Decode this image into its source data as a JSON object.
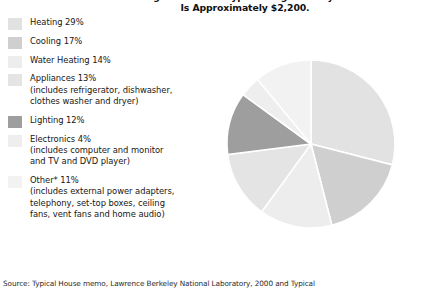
{
  "title": {
    "line1": "Average U.S. Home Typical Single Family Home",
    "line2": "Is Approximately $2,200."
  },
  "legend": [
    {
      "label": "Heating 29%",
      "swatch": "#e2e2e2",
      "name": "heating",
      "sub": []
    },
    {
      "label": "Cooling 17%",
      "swatch": "#cfcfcf",
      "name": "cooling",
      "sub": []
    },
    {
      "label": "Water Heating 14%",
      "swatch": "#ededed",
      "name": "water-heating",
      "sub": []
    },
    {
      "label": "Appliances 13%",
      "swatch": "#e4e4e4",
      "name": "appliances",
      "sub": [
        "(includes refrigerator, dishwasher,",
        "clothes washer and dryer)"
      ]
    },
    {
      "label": "Lighting 12%",
      "swatch": "#9e9e9e",
      "name": "lighting",
      "sub": []
    },
    {
      "label": "Electronics 4%",
      "swatch": "#eeeeee",
      "name": "electronics",
      "sub": [
        "(includes computer and monitor",
        "and TV and DVD player)"
      ]
    },
    {
      "label": "Other* 11%",
      "swatch": "#f2f2f2",
      "name": "other",
      "sub": [
        "(includes external power adapters,",
        "telephony, set-top boxes, ceiling",
        "fans, vent fans and home audio)"
      ]
    }
  ],
  "source": "Source: Typical House memo, Lawrence Berkeley National Laboratory, 2000 and Typical",
  "chart_data": {
    "type": "pie",
    "title": "Average U.S. Home Typical Single Family Home Is Approximately $2,200.",
    "categories": [
      "Heating",
      "Cooling",
      "Water Heating",
      "Appliances",
      "Lighting",
      "Electronics",
      "Other*"
    ],
    "values": [
      29,
      17,
      14,
      13,
      12,
      4,
      11
    ],
    "unit": "percent",
    "colors": [
      "#e2e2e2",
      "#cfcfcf",
      "#ededed",
      "#e4e4e4",
      "#9e9e9e",
      "#eeeeee",
      "#f2f2f2"
    ],
    "start_angle_deg": 0,
    "direction": "clockwise",
    "legend_position": "left",
    "grid": false,
    "xlabel": "",
    "ylabel": ""
  }
}
